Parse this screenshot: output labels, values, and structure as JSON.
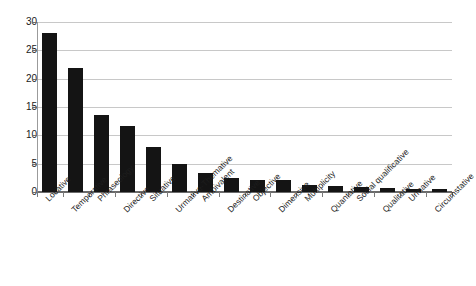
{
  "chart_data": {
    "type": "bar",
    "title": "",
    "subtitle": "",
    "xlabel": "",
    "ylabel": "",
    "ylim": [
      0,
      30
    ],
    "yticks": [
      0,
      5,
      10,
      15,
      20,
      25,
      30
    ],
    "ytick_labels": [
      "0",
      "5",
      "10",
      "15",
      "20",
      "25",
      "30"
    ],
    "grid": true,
    "legend": null,
    "legend_position": "none",
    "bar_color": "#141414",
    "gridline_color": "#c8c8c8",
    "axis_color": "#6b6b6b",
    "categories": [
      "Locative",
      "Temporative",
      "Phraseology",
      "Directive",
      "Situative",
      "Urmative-Themative",
      "Ambivalent",
      "Destinative",
      "Objective",
      "Dimensive",
      "Multiplicity",
      "Quantative",
      "Social qualificative",
      "Qualitative",
      "Urmative",
      "Circumstative"
    ],
    "values": [
      28.1,
      21.9,
      13.6,
      11.6,
      7.9,
      4.9,
      3.4,
      2.4,
      2.2,
      2.2,
      1.2,
      1.1,
      0.9,
      0.7,
      0.5,
      0.5
    ]
  }
}
